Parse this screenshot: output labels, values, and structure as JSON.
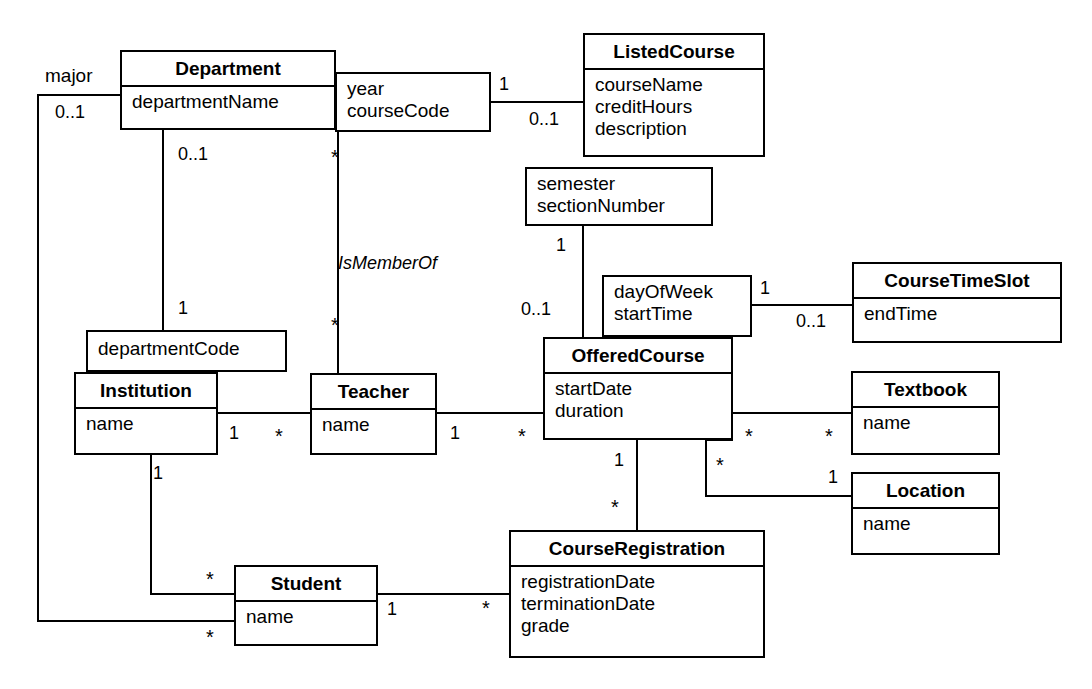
{
  "diagram": {
    "type": "uml-class-diagram",
    "stroke_color": "#000000",
    "fill_color": "#ffffff"
  },
  "classes": {
    "department": {
      "name": "Department",
      "attributes": "departmentName"
    },
    "listed_course": {
      "name": "ListedCourse",
      "attributes": "courseName\ncreditHours\ndescription"
    },
    "course_time_slot": {
      "name": "CourseTimeSlot",
      "attributes": "endTime"
    },
    "offered_course": {
      "name": "OfferedCourse",
      "attributes": "startDate\nduration"
    },
    "institution": {
      "name": "Institution",
      "attributes": "name"
    },
    "teacher": {
      "name": "Teacher",
      "attributes": "name"
    },
    "textbook": {
      "name": "Textbook",
      "attributes": "name"
    },
    "location": {
      "name": "Location",
      "attributes": "name"
    },
    "student": {
      "name": "Student",
      "attributes": "name"
    },
    "course_registration": {
      "name": "CourseRegistration",
      "attributes": "registrationDate\nterminationDate\ngrade"
    }
  },
  "association_classes": {
    "year_course_code": {
      "attributes": "year\ncourseCode"
    },
    "semester_section": {
      "attributes": "semester\nsectionNumber"
    },
    "day_start_time": {
      "attributes": "dayOfWeek\nstartTime"
    },
    "department_code": {
      "attributes": "departmentCode"
    }
  },
  "association_labels": {
    "is_member_of": "IsMemberOf",
    "major": "major"
  },
  "multiplicities": {
    "major_dept_end": "0..1",
    "dept_listed_1": "1",
    "dept_listed_01": "0..1",
    "dept_instcode_01": "0..1",
    "dept_teacher_star": "*",
    "instcode_dept_1": "1",
    "teacher_member_star": "*",
    "listed_offered_1": "1",
    "listed_offered_01": "0..1",
    "timeslot_left_1": "1",
    "timeslot_right_01": "0..1",
    "inst_teacher_1": "1",
    "inst_teacher_star": "*",
    "teacher_offered_1": "1",
    "teacher_offered_star": "*",
    "offered_textbook_star": "*",
    "textbook_offered_star": "*",
    "offered_location_star": "*",
    "location_offered_1": "1",
    "offered_reg_1": "1",
    "reg_offered_star": "*",
    "inst_student_star": "*",
    "inst_student_1": "1",
    "major_student_star": "*",
    "student_reg_1": "1",
    "reg_student_star": "*"
  }
}
